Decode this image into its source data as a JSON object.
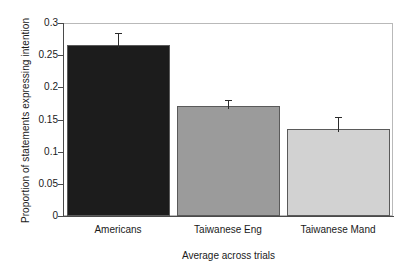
{
  "chart_data": {
    "type": "bar",
    "title": "",
    "xlabel": "Average across trials",
    "ylabel": "Proportion of statements expressing intention",
    "categories": [
      "Americans",
      "Taiwanese Eng",
      "Taiwanese Mand"
    ],
    "values": [
      0.266,
      0.171,
      0.136
    ],
    "errors": [
      0.019,
      0.009,
      0.018
    ],
    "series": [
      {
        "name": "Proportion of statements expressing intention",
        "values": [
          0.266,
          0.171,
          0.136
        ]
      }
    ],
    "bar_colors": [
      "#1c1c1c",
      "#9b9b9b",
      "#d2d2d2"
    ],
    "ylim": [
      0,
      0.3
    ],
    "yticks": [
      0,
      0.05,
      0.1,
      0.15,
      0.2,
      0.25,
      0.3
    ],
    "ytick_labels": [
      "0",
      "0.05",
      "0.1",
      "0.15",
      "0.2",
      "0.25",
      "0.3"
    ],
    "grid": false,
    "legend": "none",
    "error_bar_style": "cap"
  }
}
